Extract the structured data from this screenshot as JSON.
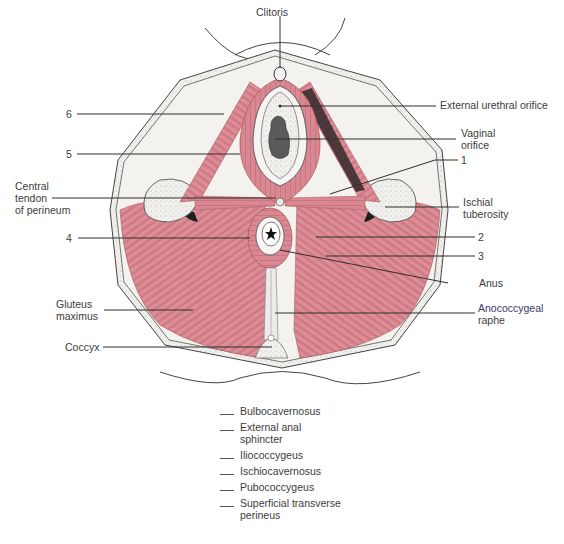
{
  "figure": {
    "colors": {
      "muscle": "#d8848e",
      "muscle_dark": "#b8606c",
      "muscle_light": "#ecb3b8",
      "fat": "#f3f1ee",
      "outline": "#3a3a3a",
      "leader": "#2e2e2e"
    }
  },
  "labels": {
    "clitoris": "Clitoris",
    "external_urethral_orifice": "External urethral orifice",
    "vaginal_orifice_1": "Vaginal",
    "vaginal_orifice_2": "orifice",
    "num_1": "1",
    "ischial_1": "Ischial",
    "ischial_2": "tuberosity",
    "num_2": "2",
    "num_3": "3",
    "anus": "Anus",
    "anococcygeal_1": "Anococcygeal",
    "anococcygeal_2": "raphe",
    "num_6": "6",
    "num_5": "5",
    "central_1": "Central",
    "central_2": "tendon",
    "central_3": "of perineum",
    "num_4": "4",
    "gluteus_1": "Gluteus",
    "gluteus_2": "maximus",
    "coccyx": "Coccyx"
  },
  "key": {
    "items": [
      {
        "text": "Bulbocavernosus"
      },
      {
        "text": "External anal sphincter"
      },
      {
        "text": "Iliococcygeus"
      },
      {
        "text": "Ischiocavernosus"
      },
      {
        "text": "Pubococcygeus"
      },
      {
        "text": "Superficial transverse perineus"
      }
    ]
  }
}
